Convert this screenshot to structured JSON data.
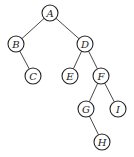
{
  "diagram": {
    "type": "binary-tree",
    "colors": {
      "stroke": "#222222",
      "fill": "#ffffff",
      "text": "#222222"
    },
    "nodes": [
      {
        "id": "A",
        "label": "A"
      },
      {
        "id": "B",
        "label": "B"
      },
      {
        "id": "C",
        "label": "C"
      },
      {
        "id": "D",
        "label": "D"
      },
      {
        "id": "E",
        "label": "E"
      },
      {
        "id": "F",
        "label": "F"
      },
      {
        "id": "G",
        "label": "G"
      },
      {
        "id": "H",
        "label": "H"
      },
      {
        "id": "I",
        "label": "I"
      }
    ],
    "edges": [
      {
        "from": "A",
        "to": "B",
        "side": "left"
      },
      {
        "from": "A",
        "to": "D",
        "side": "right"
      },
      {
        "from": "B",
        "to": "C",
        "side": "right"
      },
      {
        "from": "D",
        "to": "E",
        "side": "left"
      },
      {
        "from": "D",
        "to": "F",
        "side": "right"
      },
      {
        "from": "F",
        "to": "G",
        "side": "left"
      },
      {
        "from": "F",
        "to": "I",
        "side": "right"
      },
      {
        "from": "G",
        "to": "H",
        "side": "right"
      }
    ]
  }
}
